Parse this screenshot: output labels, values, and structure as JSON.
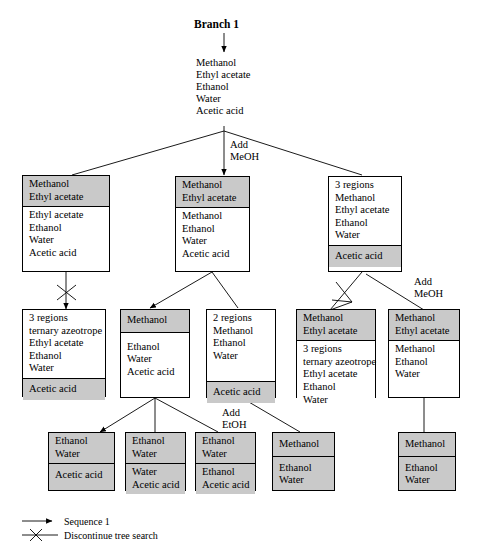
{
  "diagram": {
    "title": "Branch 1",
    "root_feed": [
      "Methanol",
      "Ethyl acetate",
      "Ethanol",
      "Water",
      "Acetic acid"
    ],
    "edge_labels": {
      "add_meoh_top": "Add\nMeOH",
      "add_meoh_right": "Add\nMeOH",
      "add_etoh": "Add\nEtOH"
    },
    "add_meoh_top_l1": "Add",
    "add_meoh_top_l2": "MeOH",
    "add_meoh_right_l1": "Add",
    "add_meoh_right_l2": "MeOH",
    "add_etoh_l1": "Add",
    "add_etoh_l2": "EtOH"
  },
  "nodes": {
    "r2c1": {
      "name": "row2-node-left",
      "top": [
        "Methanol",
        "Ethyl acetate"
      ],
      "bottom": [
        "Ethyl acetate",
        "Ethanol",
        "Water",
        "Acetic acid"
      ]
    },
    "r2c2": {
      "name": "row2-node-center",
      "top": [
        "Methanol",
        "Ethyl acetate"
      ],
      "bottom": [
        "Methanol",
        "Ethanol",
        "Water",
        "Acetic acid"
      ]
    },
    "r2c3": {
      "name": "row2-node-right",
      "top": [
        "3 regions",
        "Methanol",
        "Ethyl acetate",
        "Ethanol",
        "Water"
      ],
      "bottom": [
        "Acetic acid"
      ]
    },
    "r3c1": {
      "name": "row3-node-1",
      "top": [
        "3 regions",
        "ternary azeotrope",
        "Ethyl acetate",
        "Ethanol",
        "Water"
      ],
      "bottom": [
        "Acetic acid"
      ]
    },
    "r3c2": {
      "name": "row3-node-2",
      "top": [
        "Methanol"
      ],
      "bottom": [
        "Ethanol",
        "Water",
        "Acetic acid"
      ]
    },
    "r3c3": {
      "name": "row3-node-3",
      "top": [
        "2 regions",
        "Methanol",
        "Ethanol",
        "Water"
      ],
      "bottom": [
        "Acetic acid"
      ]
    },
    "r3c4": {
      "name": "row3-node-4",
      "top": [
        "Methanol",
        "Ethyl acetate"
      ],
      "bottom": [
        "3 regions",
        "ternary azeotrope",
        "Ethyl acetate",
        "Ethanol",
        "Water"
      ]
    },
    "r3c5": {
      "name": "row3-node-5",
      "top": [
        "Methanol",
        "Ethyl acetate"
      ],
      "bottom": [
        "Methanol",
        "Ethanol",
        "Water"
      ]
    },
    "r4c1": {
      "name": "row4-node-1",
      "top": [
        "Ethanol",
        "Water"
      ],
      "bottom": [
        "Acetic acid"
      ]
    },
    "r4c2": {
      "name": "row4-node-2",
      "top": [
        "Ethanol",
        "Water"
      ],
      "bottom": [
        "Water",
        "Acetic acid"
      ]
    },
    "r4c3": {
      "name": "row4-node-3",
      "top": [
        "Ethanol",
        "Water"
      ],
      "bottom": [
        "Ethanol",
        "Acetic acid"
      ]
    },
    "r4c4": {
      "name": "row4-node-4",
      "top": [
        "Methanol"
      ],
      "bottom": [
        "Ethanol",
        "Water"
      ]
    },
    "r4c5": {
      "name": "row4-node-5",
      "top": [
        "Methanol"
      ],
      "bottom": [
        "Ethanol",
        "Water"
      ]
    }
  },
  "legend": {
    "sequence_label": "Sequence 1",
    "discontinue_label": "Discontinue tree search"
  },
  "colors": {
    "shaded": "#c9c9c9",
    "line": "#000000",
    "background": "#ffffff"
  }
}
